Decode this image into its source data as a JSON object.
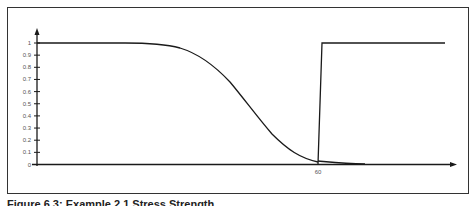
{
  "figure": {
    "caption": "Figure 6.3: Example 2.1 Stress Strength"
  },
  "chart_data": {
    "type": "line",
    "title": "",
    "xlabel": "",
    "ylabel": "",
    "ylim": [
      0,
      1
    ],
    "yticks": [
      "0",
      "0.1",
      "0.2",
      "0.3",
      "0.4",
      "0.5",
      "0.6",
      "0.7",
      "0.8",
      "0.9",
      "1"
    ],
    "xticks": [
      {
        "label": "60",
        "position": 60
      }
    ],
    "grid": false,
    "legend": null,
    "series": [
      {
        "name": "reliability-curve",
        "description": "Smooth decreasing S-curve from 1 to ~0, reaching ~0 at x=60",
        "x_rel": [
          0,
          0.2,
          0.35,
          0.45,
          0.55,
          0.62,
          0.7,
          0.8,
          0.9,
          1.0
        ],
        "values": [
          1.0,
          1.0,
          0.99,
          0.93,
          0.78,
          0.6,
          0.4,
          0.2,
          0.06,
          0.01
        ]
      },
      {
        "name": "step-function",
        "description": "Near-vertical rise from 0 to 1 at x≈60, then constant at 1",
        "values_at_60": [
          0,
          1
        ],
        "after": 1
      },
      {
        "name": "tail-density",
        "description": "Small tail near zero just right of x=60",
        "values": [
          0.03,
          0.01,
          0.0
        ]
      }
    ]
  },
  "colors": {
    "line": "#1a1a1a",
    "frame": "#333333",
    "label": "#555555"
  }
}
